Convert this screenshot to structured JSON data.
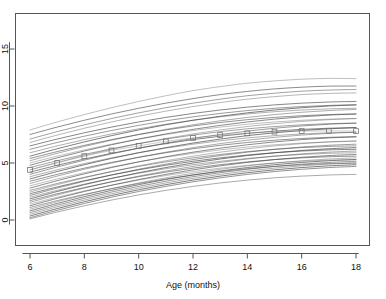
{
  "chart_data": {
    "type": "line",
    "title": "",
    "subtitle": "",
    "xlabel": "Age (months)",
    "ylabel": "",
    "xlim": [
      5.4,
      18.4
    ],
    "ylim": [
      -0.7,
      16.0
    ],
    "xticks": [
      6,
      8,
      10,
      12,
      14,
      16,
      18
    ],
    "xtick_labels": [
      "6",
      "8",
      "10",
      "12",
      "14",
      "16",
      "18"
    ],
    "yticks": [
      0,
      5,
      10,
      15
    ],
    "ytick_labels": [
      "0",
      "5",
      "10",
      "15"
    ],
    "grid": false,
    "legend": "none",
    "frame": "box",
    "line_color": "#404040",
    "marker_color": "#777777",
    "marker_shape": "open-square",
    "x": [
      6,
      7,
      8,
      9,
      10,
      11,
      12,
      13,
      14,
      15,
      16,
      17,
      18
    ],
    "highlighted_series": {
      "name": "observed-subject",
      "marker": "open-square",
      "x": [
        6,
        7,
        8,
        9,
        10,
        11,
        12,
        13,
        14,
        15,
        16,
        17,
        18
      ],
      "values": [
        4.4,
        5.0,
        5.6,
        6.1,
        6.5,
        6.9,
        7.2,
        7.45,
        7.6,
        7.75,
        7.8,
        7.82,
        7.8
      ]
    },
    "series": [
      {
        "name": "subj-01",
        "values": [
          7.9,
          8.6,
          9.25,
          9.85,
          10.4,
          10.9,
          11.35,
          11.7,
          12.0,
          12.2,
          12.35,
          12.42,
          12.4
        ]
      },
      {
        "name": "subj-02",
        "values": [
          7.5,
          8.15,
          8.75,
          9.3,
          9.8,
          10.25,
          10.65,
          11.0,
          11.28,
          11.5,
          11.65,
          11.74,
          11.75
        ]
      },
      {
        "name": "subj-03",
        "values": [
          7.1,
          7.75,
          8.35,
          8.9,
          9.4,
          9.85,
          10.25,
          10.6,
          10.9,
          11.12,
          11.3,
          11.4,
          11.45
        ]
      },
      {
        "name": "subj-04",
        "values": [
          6.8,
          7.45,
          8.05,
          8.6,
          9.1,
          9.55,
          9.95,
          10.3,
          10.6,
          10.82,
          11.0,
          11.1,
          11.15
        ]
      },
      {
        "name": "subj-05",
        "values": [
          6.5,
          7.1,
          7.65,
          8.15,
          8.6,
          9.0,
          9.35,
          9.65,
          9.9,
          10.1,
          10.25,
          10.35,
          10.4
        ]
      },
      {
        "name": "subj-06",
        "values": [
          6.2,
          6.8,
          7.35,
          7.85,
          8.3,
          8.7,
          9.05,
          9.35,
          9.6,
          9.8,
          9.95,
          10.05,
          10.1
        ]
      },
      {
        "name": "subj-07",
        "values": [
          5.9,
          6.5,
          7.05,
          7.55,
          8.0,
          8.4,
          8.75,
          9.05,
          9.3,
          9.5,
          9.65,
          9.75,
          9.8
        ]
      },
      {
        "name": "subj-08",
        "values": [
          5.6,
          6.25,
          6.85,
          7.4,
          7.9,
          8.35,
          8.75,
          9.1,
          9.4,
          9.65,
          9.85,
          10.0,
          10.1
        ]
      },
      {
        "name": "subj-09",
        "values": [
          5.4,
          6.0,
          6.55,
          7.05,
          7.5,
          7.9,
          8.25,
          8.55,
          8.8,
          9.0,
          9.15,
          9.25,
          9.3
        ]
      },
      {
        "name": "subj-10",
        "values": [
          5.2,
          5.85,
          6.45,
          7.0,
          7.5,
          7.95,
          8.35,
          8.7,
          9.0,
          9.25,
          9.45,
          9.6,
          9.7
        ]
      },
      {
        "name": "subj-11",
        "values": [
          5.0,
          5.6,
          6.15,
          6.65,
          7.1,
          7.5,
          7.85,
          8.15,
          8.4,
          8.6,
          8.75,
          8.85,
          8.9
        ]
      },
      {
        "name": "subj-12",
        "values": [
          4.8,
          5.45,
          6.05,
          6.6,
          7.1,
          7.55,
          7.95,
          8.3,
          8.6,
          8.85,
          9.05,
          9.2,
          9.3
        ]
      },
      {
        "name": "subj-13",
        "values": [
          4.6,
          5.2,
          5.75,
          6.25,
          6.7,
          7.1,
          7.45,
          7.75,
          8.0,
          8.2,
          8.35,
          8.45,
          8.5
        ]
      },
      {
        "name": "subj-14",
        "values": [
          4.4,
          5.05,
          5.65,
          6.2,
          6.7,
          7.15,
          7.55,
          7.9,
          8.2,
          8.45,
          8.65,
          8.8,
          8.9
        ]
      },
      {
        "name": "subj-15",
        "values": [
          4.2,
          4.8,
          5.35,
          5.85,
          6.3,
          6.7,
          7.05,
          7.35,
          7.6,
          7.8,
          7.95,
          8.05,
          8.1
        ]
      },
      {
        "name": "subj-16",
        "values": [
          4.0,
          4.65,
          5.25,
          5.8,
          6.3,
          6.75,
          7.15,
          7.5,
          7.8,
          8.05,
          8.25,
          8.4,
          8.5
        ]
      },
      {
        "name": "subj-17",
        "values": [
          3.8,
          4.4,
          4.95,
          5.45,
          5.9,
          6.3,
          6.65,
          6.95,
          7.2,
          7.4,
          7.55,
          7.65,
          7.7
        ]
      },
      {
        "name": "subj-18",
        "values": [
          3.6,
          4.25,
          4.85,
          5.4,
          5.9,
          6.35,
          6.75,
          7.1,
          7.4,
          7.65,
          7.85,
          8.0,
          8.1
        ]
      },
      {
        "name": "subj-19",
        "values": [
          3.4,
          4.0,
          4.55,
          5.05,
          5.5,
          5.9,
          6.25,
          6.55,
          6.8,
          7.0,
          7.15,
          7.25,
          7.3
        ]
      },
      {
        "name": "subj-20",
        "values": [
          3.2,
          3.85,
          4.45,
          5.0,
          5.5,
          5.95,
          6.35,
          6.7,
          7.0,
          7.25,
          7.45,
          7.6,
          7.7
        ]
      },
      {
        "name": "subj-21",
        "values": [
          3.0,
          3.6,
          4.15,
          4.65,
          5.1,
          5.5,
          5.85,
          6.15,
          6.4,
          6.6,
          6.75,
          6.85,
          6.9
        ]
      },
      {
        "name": "subj-22",
        "values": [
          2.8,
          3.45,
          4.05,
          4.6,
          5.1,
          5.55,
          5.95,
          6.3,
          6.6,
          6.85,
          7.05,
          7.2,
          7.3
        ]
      },
      {
        "name": "subj-23",
        "values": [
          2.6,
          3.2,
          3.75,
          4.25,
          4.7,
          5.1,
          5.45,
          5.75,
          6.0,
          6.2,
          6.35,
          6.45,
          6.5
        ]
      },
      {
        "name": "subj-24",
        "values": [
          2.45,
          3.1,
          3.7,
          4.25,
          4.75,
          5.2,
          5.6,
          5.95,
          6.25,
          6.5,
          6.7,
          6.85,
          6.95
        ]
      },
      {
        "name": "subj-25",
        "values": [
          2.3,
          2.9,
          3.45,
          3.95,
          4.4,
          4.8,
          5.15,
          5.45,
          5.7,
          5.9,
          6.05,
          6.15,
          6.2
        ]
      },
      {
        "name": "subj-26",
        "values": [
          2.15,
          2.8,
          3.4,
          3.95,
          4.45,
          4.9,
          5.3,
          5.65,
          5.95,
          6.2,
          6.4,
          6.55,
          6.65
        ]
      },
      {
        "name": "subj-27",
        "values": [
          2.0,
          2.6,
          3.15,
          3.65,
          4.1,
          4.5,
          4.85,
          5.15,
          5.4,
          5.6,
          5.75,
          5.85,
          5.9
        ]
      },
      {
        "name": "subj-28",
        "values": [
          1.85,
          2.5,
          3.1,
          3.65,
          4.15,
          4.6,
          5.0,
          5.35,
          5.65,
          5.9,
          6.1,
          6.25,
          6.35
        ]
      },
      {
        "name": "subj-29",
        "values": [
          1.7,
          2.3,
          2.85,
          3.35,
          3.8,
          4.2,
          4.55,
          4.85,
          5.1,
          5.3,
          5.45,
          5.55,
          5.6
        ]
      },
      {
        "name": "subj-30",
        "values": [
          1.55,
          2.2,
          2.8,
          3.35,
          3.85,
          4.3,
          4.7,
          5.05,
          5.35,
          5.6,
          5.8,
          5.95,
          6.05
        ]
      },
      {
        "name": "subj-31",
        "values": [
          1.4,
          2.0,
          2.55,
          3.05,
          3.5,
          3.9,
          4.25,
          4.55,
          4.8,
          5.0,
          5.15,
          5.25,
          5.3
        ]
      },
      {
        "name": "subj-32",
        "values": [
          1.25,
          1.9,
          2.5,
          3.05,
          3.55,
          4.0,
          4.4,
          4.75,
          5.05,
          5.3,
          5.5,
          5.65,
          5.75
        ]
      },
      {
        "name": "subj-33",
        "values": [
          1.1,
          1.7,
          2.25,
          2.75,
          3.2,
          3.6,
          3.95,
          4.25,
          4.5,
          4.7,
          4.85,
          4.95,
          5.0
        ]
      },
      {
        "name": "subj-34",
        "values": [
          0.95,
          1.6,
          2.2,
          2.75,
          3.25,
          3.7,
          4.1,
          4.45,
          4.75,
          5.0,
          5.2,
          5.35,
          5.45
        ]
      },
      {
        "name": "subj-35",
        "values": [
          0.8,
          1.45,
          2.05,
          2.6,
          3.1,
          3.55,
          3.95,
          4.3,
          4.6,
          4.85,
          5.05,
          5.2,
          5.3
        ]
      },
      {
        "name": "subj-36",
        "values": [
          0.65,
          1.3,
          1.9,
          2.45,
          2.95,
          3.4,
          3.8,
          4.15,
          4.45,
          4.7,
          4.9,
          5.05,
          5.15
        ]
      },
      {
        "name": "subj-37",
        "values": [
          0.5,
          1.15,
          1.75,
          2.3,
          2.8,
          3.25,
          3.65,
          4.0,
          4.3,
          4.55,
          4.75,
          4.9,
          5.0
        ]
      },
      {
        "name": "subj-38",
        "values": [
          0.35,
          1.0,
          1.6,
          2.15,
          2.65,
          3.1,
          3.5,
          3.85,
          4.15,
          4.4,
          4.6,
          4.75,
          4.85
        ]
      },
      {
        "name": "subj-39",
        "values": [
          0.2,
          0.85,
          1.45,
          2.0,
          2.5,
          2.95,
          3.35,
          3.7,
          4.0,
          4.25,
          4.45,
          4.6,
          4.7
        ]
      },
      {
        "name": "subj-40",
        "values": [
          0.1,
          0.7,
          1.25,
          1.75,
          2.2,
          2.6,
          2.95,
          3.25,
          3.5,
          3.7,
          3.85,
          3.95,
          4.0
        ]
      }
    ]
  },
  "axes": {
    "x_title": "Age (months)",
    "y_title": ""
  }
}
